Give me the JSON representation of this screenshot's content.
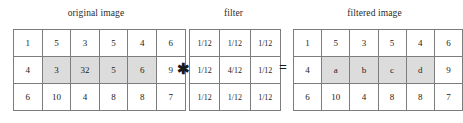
{
  "figure": {
    "captions": {
      "original": "original image",
      "filter": "filter",
      "filtered": "filtered image"
    },
    "operators": {
      "convolve": "✱",
      "equals": "="
    },
    "colors": {
      "shaded_cell": "#dcdcdc",
      "cell_border": "#7d7d7d",
      "text": "#222222",
      "background": "#ffffff"
    }
  },
  "original_image": {
    "rows": 3,
    "cols": 6,
    "cells": [
      [
        {
          "v": "1",
          "shaded": false
        },
        {
          "v": "5",
          "shaded": false
        },
        {
          "v": "3",
          "shaded": false
        },
        {
          "v": "5",
          "shaded": false
        },
        {
          "v": "4",
          "shaded": false
        },
        {
          "v": "6",
          "shaded": false
        }
      ],
      [
        {
          "v": "4",
          "shaded": false
        },
        {
          "v": "3",
          "shaded": true
        },
        {
          "v": "32",
          "shaded": true
        },
        {
          "v": "5",
          "shaded": true
        },
        {
          "v": "6",
          "shaded": true
        },
        {
          "v": "9",
          "shaded": false
        }
      ],
      [
        {
          "v": "6",
          "shaded": false
        },
        {
          "v": "10",
          "shaded": false
        },
        {
          "v": "4",
          "shaded": false
        },
        {
          "v": "8",
          "shaded": false
        },
        {
          "v": "8",
          "shaded": false
        },
        {
          "v": "7",
          "shaded": false
        }
      ]
    ]
  },
  "filter": {
    "rows": 3,
    "cols": 3,
    "cells": [
      [
        {
          "v": "1/12",
          "shaded": false
        },
        {
          "v": "1/12",
          "shaded": false
        },
        {
          "v": "1/12",
          "shaded": false
        }
      ],
      [
        {
          "v": "1/12",
          "shaded": false
        },
        {
          "v": "4/12",
          "shaded": false
        },
        {
          "v": "1/12",
          "shaded": false
        }
      ],
      [
        {
          "v": "1/12",
          "shaded": false
        },
        {
          "v": "1/12",
          "shaded": false
        },
        {
          "v": "1/12",
          "shaded": false
        }
      ]
    ]
  },
  "filtered_image": {
    "rows": 3,
    "cols": 6,
    "cells": [
      [
        {
          "v": "1",
          "shaded": false
        },
        {
          "v": "5",
          "shaded": false
        },
        {
          "v": "3",
          "shaded": false
        },
        {
          "v": "5",
          "shaded": false
        },
        {
          "v": "4",
          "shaded": false
        },
        {
          "v": "6",
          "shaded": false
        }
      ],
      [
        {
          "v": "4",
          "shaded": false
        },
        {
          "v": "a",
          "shaded": true
        },
        {
          "v": "b",
          "shaded": true
        },
        {
          "v": "c",
          "shaded": true
        },
        {
          "v": "d",
          "shaded": true
        },
        {
          "v": "9",
          "shaded": false
        }
      ],
      [
        {
          "v": "6",
          "shaded": false
        },
        {
          "v": "10",
          "shaded": false
        },
        {
          "v": "4",
          "shaded": false
        },
        {
          "v": "8",
          "shaded": false
        },
        {
          "v": "8",
          "shaded": false
        },
        {
          "v": "7",
          "shaded": false
        }
      ]
    ]
  }
}
